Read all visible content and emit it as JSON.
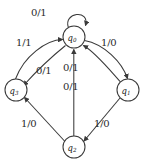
{
  "diagram": {
    "kind": "finite-state-machine",
    "title": "",
    "stroke_color": "#3a3a3a",
    "text_color": "#2b2b2b",
    "background": "#ffffff",
    "nodes": [
      {
        "id": "q0",
        "name": "q",
        "sub": "0",
        "cx": 74,
        "cy": 37,
        "r": 11
      },
      {
        "id": "q1",
        "name": "q",
        "sub": "1",
        "cx": 128,
        "cy": 90,
        "r": 11
      },
      {
        "id": "q2",
        "name": "q",
        "sub": "2",
        "cx": 74,
        "cy": 147,
        "r": 11
      },
      {
        "id": "q3",
        "name": "q",
        "sub": "3",
        "cx": 16,
        "cy": 90,
        "r": 11
      }
    ],
    "edges": [
      {
        "id": "e-q0-q0",
        "from": "q0",
        "to": "q0",
        "label": "0/1",
        "lx": 31,
        "ly": 8
      },
      {
        "id": "e-q3-q0",
        "from": "q3",
        "to": "q0",
        "label": "1/1",
        "lx": 16,
        "ly": 38
      },
      {
        "id": "e-q0-q3",
        "from": "q0",
        "to": "q3",
        "label": "0/1",
        "lx": 36,
        "ly": 66
      },
      {
        "id": "e-q0-q1",
        "from": "q0",
        "to": "q1",
        "label": "1/0",
        "lx": 101,
        "ly": 38
      },
      {
        "id": "e-q1-q0",
        "from": "q1",
        "to": "q0",
        "label": "0/1",
        "lx": 63,
        "ly": 63
      },
      {
        "id": "e-q2-q0",
        "from": "q2",
        "to": "q0",
        "label": "0/1",
        "lx": 63,
        "ly": 82
      },
      {
        "id": "e-q2-q3",
        "from": "q2",
        "to": "q3",
        "label": "1/0",
        "lx": 21,
        "ly": 119
      },
      {
        "id": "e-q1-q2",
        "from": "q1",
        "to": "q2",
        "label": "1/0",
        "lx": 94,
        "ly": 119
      }
    ]
  }
}
